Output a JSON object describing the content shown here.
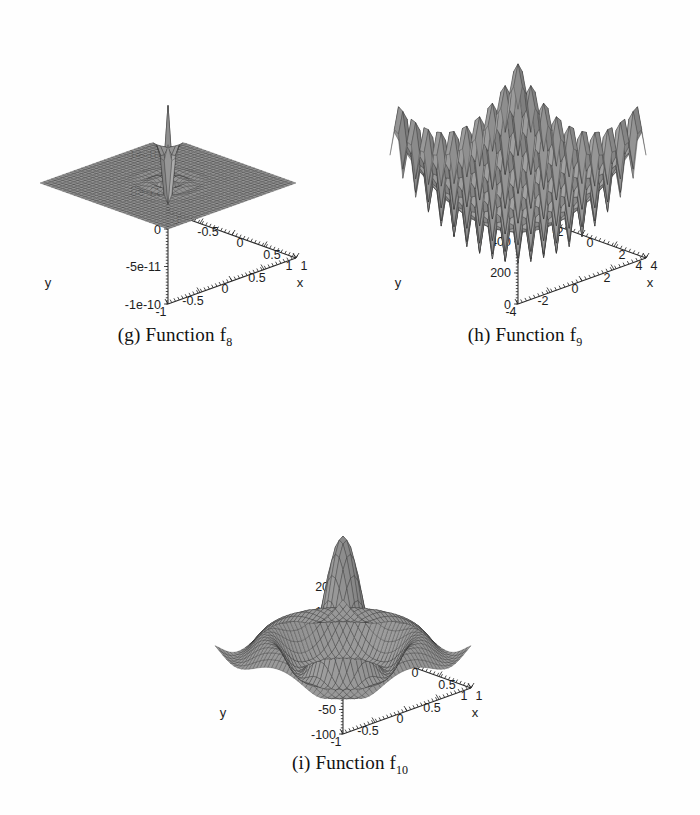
{
  "figure": {
    "background": "#fefefe",
    "ink": "#1d1d1d",
    "panel_count": 3
  },
  "panels": [
    {
      "key": "g",
      "caption_prefix": "(g) Function f",
      "caption_sub": "8",
      "zaxis_label": "",
      "xaxis_label": "x",
      "yaxis_label": "y"
    },
    {
      "key": "h",
      "caption_prefix": "(h) Function f",
      "caption_sub": "9",
      "zaxis_label": "",
      "xaxis_label": "x",
      "yaxis_label": "y"
    },
    {
      "key": "i",
      "caption_prefix": "(i) Function f",
      "caption_sub": "10",
      "zaxis_label": "",
      "xaxis_label": "x",
      "yaxis_label": "y"
    }
  ],
  "chart_data": [
    {
      "type": "surface",
      "panel": "g",
      "title": "(g) Function f8",
      "xlabel": "x",
      "ylabel": "y",
      "zlabel": "",
      "xticks": [
        -1,
        -0.5,
        0,
        0.5,
        1
      ],
      "xticklabels": [
        "-1",
        "-0.5",
        "0",
        "0.5",
        "1"
      ],
      "yticks": [
        -1,
        -0.5,
        0,
        0.5,
        1
      ],
      "yticklabels": [
        "-1",
        "-0.5",
        "0",
        "0.5",
        "1"
      ],
      "zticks": [
        -1e-10,
        -5e-11,
        0,
        5e-11,
        1e-10
      ],
      "zticklabels": [
        "-1e-10",
        "-5e-11",
        "0",
        "5e-11",
        "1e-10"
      ],
      "xlim": [
        -1,
        1
      ],
      "ylim": [
        -1,
        1
      ],
      "zlim": [
        -1.3e-10,
        1.3e-10
      ],
      "grid": true,
      "mesh_n": 34,
      "shape": "flat-plateau-with-central-spike",
      "description": "Near-zero flat plateau over the whole domain with a single very sharp positive spike rising to ~1e-10 at the centre and a matching sharp negative spike dipping to ~-1e-10 at the front corner.",
      "surface_expr": "spike",
      "amplitude": 1.0
    },
    {
      "type": "surface",
      "panel": "h",
      "title": "(h) Function f9",
      "xlabel": "x",
      "ylabel": "y",
      "zlabel": "",
      "xticks": [
        -4,
        -2,
        0,
        2,
        4
      ],
      "xticklabels": [
        "-4",
        "-2",
        "0",
        "2",
        "4"
      ],
      "yticks": [
        -4,
        -2,
        0,
        2,
        4
      ],
      "yticklabels": [
        "-4",
        "-2",
        "0",
        "2",
        "4"
      ],
      "zticks": [
        0,
        200,
        400,
        600,
        1000
      ],
      "zticklabels": [
        "0",
        "200",
        "400",
        "600",
        "1000"
      ],
      "ztick_note": "topmost label 1000 is clipped by the figure edge and reads as 000",
      "xlim": [
        -5,
        5
      ],
      "ylim": [
        -5,
        5
      ],
      "zlim": [
        0,
        1000
      ],
      "grid": true,
      "mesh_n": 30,
      "shape": "multimodal-bowl",
      "description": "Broad bowl-shaped multimodal landscape (Rastrigin-like): rim rising toward ~1000 at the far corners, many regularly spaced local minima and maxima across the basin, with a narrow pale spike near the front centre.",
      "surface_expr": "rastrigin",
      "amplitude": 1000.0
    },
    {
      "type": "surface",
      "panel": "i",
      "title": "(i) Function f10",
      "xlabel": "x",
      "ylabel": "y",
      "zlabel": "",
      "xticks": [
        -1,
        -0.5,
        0,
        0.5,
        1
      ],
      "xticklabels": [
        "-1",
        "-0.5",
        "0",
        "0.5",
        "1"
      ],
      "yticks": [
        -1,
        -0.5,
        0,
        0.5,
        1
      ],
      "yticklabels": [
        "-1",
        "-0.5",
        "0",
        "0.5",
        "1"
      ],
      "zticks": [
        -100,
        -50,
        0,
        50,
        100,
        150,
        200
      ],
      "zticklabels": [
        "-100",
        "-50",
        "0",
        "50",
        "100",
        "150",
        "200"
      ],
      "xlim": [
        -1,
        1
      ],
      "ylim": [
        -1,
        1
      ],
      "zlim": [
        -100,
        210
      ],
      "grid": true,
      "mesh_n": 34,
      "shape": "central-peak-with-concentric-ripples",
      "description": "Tall narrow central peak reaching about 200, surrounded by a ring-shaped trough near -60 and an outer ring of four secondary humps at roughly 40 to 60, a radially damped oscillation.",
      "surface_expr": "sinc",
      "amplitude": 200.0
    }
  ]
}
